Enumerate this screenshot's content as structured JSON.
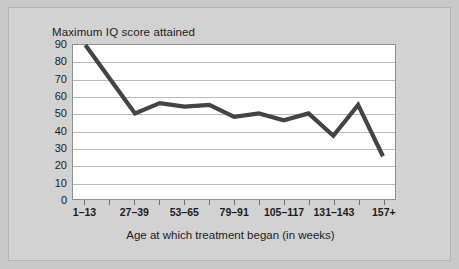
{
  "chart_data": {
    "type": "line",
    "title": "Maximum IQ score attained",
    "xlabel": "Age at which treatment began (in weeks)",
    "ylabel": "Maximum IQ score attained",
    "ylim": [
      0,
      90
    ],
    "y_ticks": [
      0,
      10,
      20,
      30,
      40,
      50,
      60,
      70,
      80,
      90
    ],
    "grid": true,
    "legend": null,
    "line_color": "#444444",
    "categories": [
      "1–13",
      "14–26",
      "27–39",
      "40–52",
      "53–65",
      "66–78",
      "79–91",
      "92–104",
      "105–117",
      "118–130",
      "131–143",
      "144–156",
      "157+"
    ],
    "x_tick_labels_visible": [
      "1–13",
      "27–39",
      "53–65",
      "79–91",
      "105–117",
      "131–143",
      "157+"
    ],
    "values": [
      90,
      70,
      50,
      56,
      54,
      55,
      48,
      50,
      46,
      50,
      37,
      55,
      25
    ],
    "x_positions_frac": [
      0.0385,
      0.1155,
      0.1925,
      0.2695,
      0.3465,
      0.4235,
      0.5005,
      0.5775,
      0.6545,
      0.7315,
      0.8085,
      0.8855,
      0.9625
    ]
  },
  "figure": {
    "background_color": "#d2d2d2",
    "plot_background_color": "#ffffff",
    "border_color": "#8d8d8d",
    "gridline_color": "#b9b9b9"
  }
}
